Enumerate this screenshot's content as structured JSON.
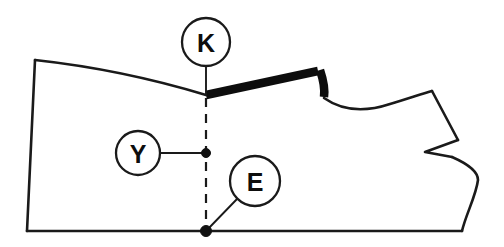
{
  "diagram": {
    "background_color": "#ffffff",
    "line_color": "#1a1a1a",
    "seam_color": "#0d0d0d",
    "width": 504,
    "height": 247
  },
  "callouts": [
    {
      "id": "K",
      "label": "K",
      "name": "callout-k",
      "cx": 206,
      "cy": 42,
      "r": 24,
      "leader_from": [
        206,
        66
      ],
      "leader_to": [
        206,
        95
      ],
      "description": "shoulder seam end point marker"
    },
    {
      "id": "Y",
      "label": "Y",
      "name": "callout-y",
      "cx": 138,
      "cy": 153,
      "r": 22,
      "leader_from": [
        160,
        153
      ],
      "leader_to": [
        206,
        153
      ],
      "description": "mid grainline point marker"
    },
    {
      "id": "E",
      "label": "E",
      "name": "callout-e",
      "cx": 255,
      "cy": 181,
      "r": 25,
      "leader_from": [
        238,
        198
      ],
      "leader_to": [
        206,
        231
      ],
      "description": "hem grainline point marker"
    }
  ],
  "points": [
    {
      "name": "point-y",
      "x": 206,
      "y": 153,
      "r": 4.5
    },
    {
      "name": "point-e",
      "x": 206,
      "y": 231,
      "r": 5.5
    }
  ],
  "paths": {
    "outline": "M 35,60 C 90,66 150,78 206,95 L 206,231 L 462,231 C 460,215 458,200 462,186 C 470,180 476,176 478,172 C 472,166 464,160 452,156 L 425,152 L 457,139 L 438,100 C 434,96 432,93 432,92 C 410,98 392,104 376,108 C 358,108 340,104 325,98 L 320,72 L 206,95",
    "left_edge": "M 35,60 L 27,231",
    "bottom_edge": "M 27,231 L 462,231",
    "top_curve": "M 35,60 C 90,66 150,78 206,95",
    "thick_seam": "M 206,95 L 318,71",
    "thick_hook": "M 320,70 C 324,82 325,90 324,97",
    "neck_curve": "M 324,98 C 344,112 366,112 390,104 C 410,98 424,93 432,91",
    "right_upper": "M 432,91 L 458,140",
    "notch": "M 458,140 L 425,152 L 452,157",
    "right_lower": "M 452,157 C 468,164 478,172 478,180 C 476,196 466,214 462,231",
    "grainline_dashed": "M 206,98 L 206,231"
  },
  "annotations": {
    "seam_label": "reinforced shoulder seam",
    "grainline_label": "grainline / center reference",
    "notch_label": "balance notch"
  }
}
